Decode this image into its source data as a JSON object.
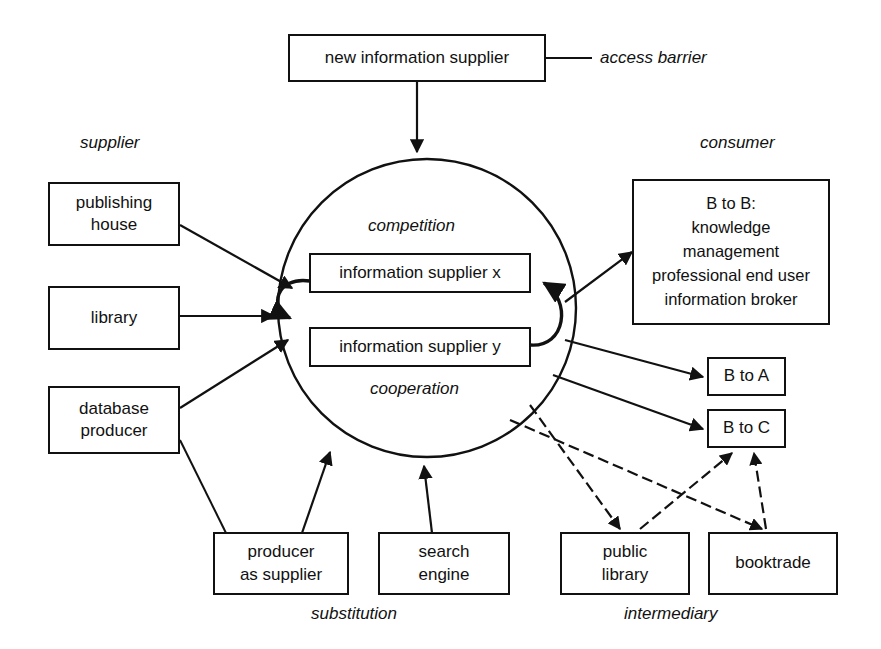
{
  "diagram": {
    "colors": {
      "stroke": "#111111",
      "background": "#ffffff",
      "text": "#111111"
    },
    "nodes": {
      "new_supplier": "new information supplier",
      "publishing_house": "publishing\nhouse",
      "library": "library",
      "database_producer": "database\nproducer",
      "supplier_x": "information supplier x",
      "supplier_y": "information supplier y",
      "b_to_b": "B to B:\nknowledge\nmanagement\nprofessional end user\ninformation broker",
      "b_to_a": "B to A",
      "b_to_c": "B to C",
      "producer_as_supplier": "producer\nas supplier",
      "search_engine": "search\nengine",
      "public_library": "public\nlibrary",
      "booktrade": "booktrade"
    },
    "labels": {
      "access_barrier": "access barrier",
      "supplier": "supplier",
      "consumer": "consumer",
      "competition": "competition",
      "cooperation": "cooperation",
      "substitution": "substitution",
      "intermediary": "intermediary"
    }
  }
}
